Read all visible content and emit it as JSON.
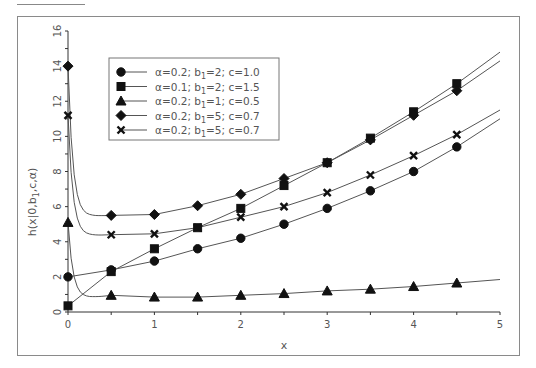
{
  "chart_data": {
    "type": "line",
    "title": "",
    "xlabel": "x",
    "ylabel": "h(x|0,b1,c,α)",
    "xlim": [
      0,
      5
    ],
    "ylim": [
      0,
      16
    ],
    "xticks": [
      "0",
      "1",
      "2",
      "3",
      "4",
      "5"
    ],
    "yticks": [
      "0",
      "2",
      "4",
      "6",
      "8",
      "10",
      "12",
      "14",
      "16"
    ],
    "grid": false,
    "legend_position": "upper-left-inside",
    "x": [
      0,
      0.5,
      1,
      1.5,
      2,
      2.5,
      3,
      3.5,
      4,
      4.5
    ],
    "series": [
      {
        "name": "α=0.2; b1=2; c=1.0",
        "marker": "circle",
        "values": [
          2.0,
          2.4,
          2.9,
          3.6,
          4.2,
          5.0,
          5.9,
          6.9,
          8.0,
          9.4
        ],
        "end_value": 11.0
      },
      {
        "name": "α=0.1; b1=2; c=1.5",
        "marker": "square",
        "values": [
          0.35,
          2.3,
          3.6,
          4.8,
          5.9,
          7.2,
          8.5,
          9.9,
          11.4,
          13.0
        ],
        "end_value": 14.8
      },
      {
        "name": "α=0.2; b1=1; c=0.5",
        "marker": "triangle",
        "values": [
          5.1,
          0.95,
          0.85,
          0.85,
          0.95,
          1.05,
          1.2,
          1.3,
          1.45,
          1.65
        ],
        "end_value": 1.85
      },
      {
        "name": "α=0.2; b1=5; c=0.7",
        "marker": "diamond",
        "values": [
          14.0,
          5.5,
          5.55,
          6.05,
          6.7,
          7.6,
          8.5,
          9.8,
          11.2,
          12.6
        ],
        "end_value": 14.3
      },
      {
        "name": "α=0.2; b1=5; c=0.7",
        "marker": "x",
        "values": [
          11.2,
          4.4,
          4.45,
          4.8,
          5.4,
          6.0,
          6.8,
          7.8,
          8.9,
          10.1
        ],
        "end_value": 11.5
      }
    ]
  },
  "labels": {
    "xlabel": "x",
    "ylabel": "h(x|0,b",
    "ylabel_sub": "1",
    "ylabel_tail": ",c,α)"
  },
  "legend": [
    {
      "alpha": "α=0.2; b",
      "sub": "1",
      "rest": "=2;  c=1.0"
    },
    {
      "alpha": "α=0.1; b",
      "sub": "1",
      "rest": "=2;  c=1.5"
    },
    {
      "alpha": "α=0.2; b",
      "sub": "1",
      "rest": "=1;  c=0.5"
    },
    {
      "alpha": "α=0.2; b",
      "sub": "1",
      "rest": "=5;  c=0.7"
    },
    {
      "alpha": "α=0.2; b",
      "sub": "1",
      "rest": "=5;  c=0.7"
    }
  ]
}
